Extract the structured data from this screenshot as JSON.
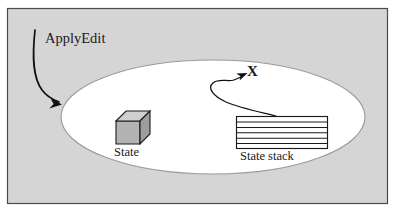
{
  "figure": {
    "kind": "state-machine-diagram",
    "page_background": "#ffffff",
    "panel": {
      "fill": "#d5d5d5",
      "border_color": "#4a4a4a",
      "x": 7,
      "y": 8,
      "width": 381,
      "height": 196
    },
    "ellipse": {
      "name": "state-space-ellipse",
      "fill": "#ffffff",
      "stroke": "#9a9a9a",
      "cx": 213,
      "cy": 117,
      "rx": 152,
      "ry": 57
    },
    "labels": {
      "applyedit": "ApplyEdit",
      "state": "State",
      "state_stack": "State stack",
      "x_point": "X"
    },
    "cube": {
      "name": "state-cube",
      "front_fill": "#b3b3b3",
      "top_fill": "#cfcfcf",
      "side_fill": "#9d9d9d",
      "stroke": "#1a1a1a"
    },
    "stack": {
      "name": "state-stack-shape",
      "fill": "#ffffff",
      "stroke": "#1a1a1a",
      "slot_count": 6,
      "x": 236,
      "y": 116,
      "width": 92,
      "height": 33
    },
    "arrows": {
      "applyedit_arrow": {
        "name": "applyedit-arrow",
        "stroke": "#111111",
        "description": "curve from ApplyEdit label down into the ellipse"
      },
      "x_arrow": {
        "name": "transition-arrow-to-x",
        "stroke": "#111111",
        "description": "S-curve from top of state stack looping to point X"
      }
    }
  }
}
